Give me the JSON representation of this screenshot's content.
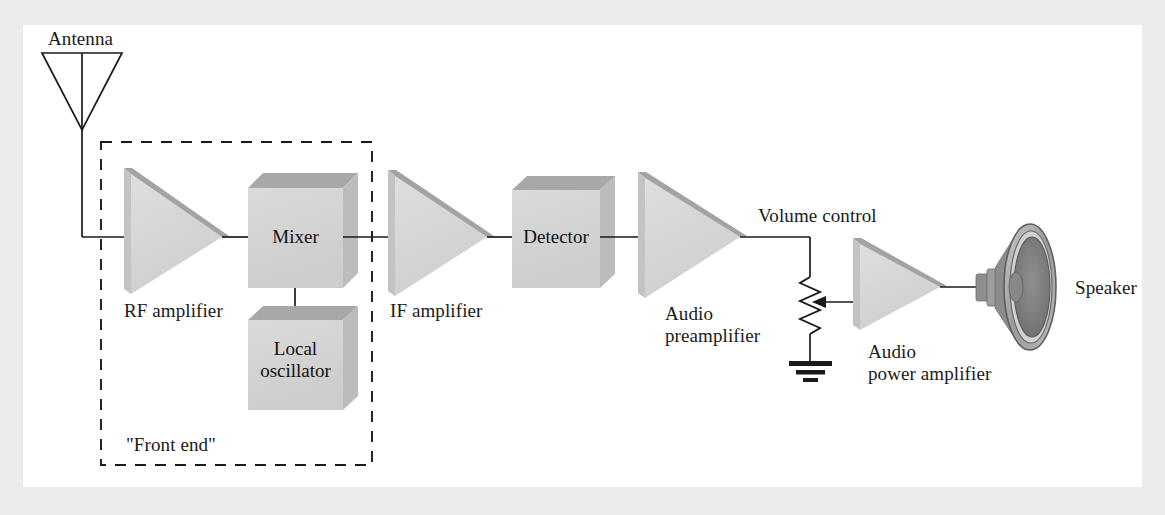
{
  "figure": {
    "background_color": "#ececed",
    "panel_color": "#ffffff",
    "line_color": "#1a1a1a",
    "block_face_color": "#d4d4d4",
    "block_top_color": "#a8a8a8",
    "block_side_color": "#bcbcbc",
    "amp_face_color": "#d6d6d6",
    "amp_edge_color": "#a3a3a3"
  },
  "labels": {
    "antenna": "Antenna",
    "rf_amplifier": "RF amplifier",
    "mixer": "Mixer",
    "local_oscillator_line1": "Local",
    "local_oscillator_line2": "oscillator",
    "front_end": "\"Front end\"",
    "if_amplifier": "IF amplifier",
    "detector": "Detector",
    "audio_preamplifier_line1": "Audio",
    "audio_preamplifier_line2": "preamplifier",
    "volume_control": "Volume control",
    "audio_power_amplifier_line1": "Audio",
    "audio_power_amplifier_line2": "power amplifier",
    "speaker": "Speaker"
  },
  "blocks": [
    {
      "id": "antenna",
      "type": "antenna",
      "label": "Antenna"
    },
    {
      "id": "rf-amplifier",
      "type": "amplifier",
      "label": "RF amplifier"
    },
    {
      "id": "mixer",
      "type": "box",
      "label": "Mixer"
    },
    {
      "id": "local-oscillator",
      "type": "box",
      "label": "Local oscillator"
    },
    {
      "id": "if-amplifier",
      "type": "amplifier",
      "label": "IF amplifier"
    },
    {
      "id": "detector",
      "type": "box",
      "label": "Detector"
    },
    {
      "id": "audio-preamplifier",
      "type": "amplifier",
      "label": "Audio preamplifier"
    },
    {
      "id": "volume-control",
      "type": "potentiometer",
      "label": "Volume control"
    },
    {
      "id": "audio-power-amplifier",
      "type": "amplifier",
      "label": "Audio power amplifier"
    },
    {
      "id": "speaker",
      "type": "speaker",
      "label": "Speaker"
    }
  ],
  "groups": [
    {
      "id": "front-end",
      "label": "\"Front end\"",
      "style": "dashed",
      "contains": [
        "rf-amplifier",
        "mixer",
        "local-oscillator"
      ]
    }
  ],
  "signal_path": [
    "antenna",
    "rf-amplifier",
    "mixer",
    "if-amplifier",
    "detector",
    "audio-preamplifier",
    "volume-control",
    "audio-power-amplifier",
    "speaker"
  ]
}
